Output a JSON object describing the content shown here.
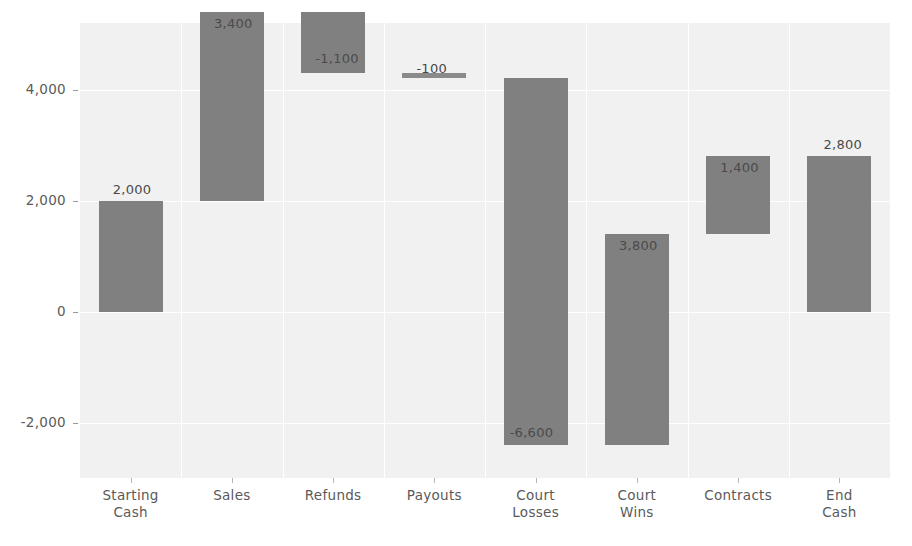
{
  "chart_data": {
    "type": "bar",
    "subtype": "waterfall",
    "title": "",
    "subtitle": "",
    "xlabel": "",
    "ylabel": "",
    "legend": [],
    "legend_position": "none",
    "grid": true,
    "ylim": [
      -3000,
      5200
    ],
    "yticks": [
      -2000,
      0,
      2000,
      4000
    ],
    "ytick_labels": [
      "-2,000",
      "0",
      "2,000",
      "4,000"
    ],
    "categories": [
      "Starting\nCash",
      "Sales",
      "Refunds",
      "Payouts",
      "Court\nLosses",
      "Court\nWins",
      "Contracts",
      "End\nCash"
    ],
    "values": [
      2000,
      3400,
      -1100,
      -100,
      -6600,
      3800,
      1400,
      2800
    ],
    "data_labels": [
      "2,000",
      "3,400",
      "-1,100",
      "-100",
      "-6,600",
      "3,800",
      "1,400",
      "2,800"
    ],
    "bars": [
      {
        "category": "Starting\nCash",
        "label": "2,000",
        "value": 2000,
        "base": 0,
        "top": 2000,
        "type": "total"
      },
      {
        "category": "Sales",
        "label": "3,400",
        "value": 3400,
        "base": 2000,
        "top": 5400,
        "type": "increase"
      },
      {
        "category": "Refunds",
        "label": "-1,100",
        "value": -1100,
        "base": 5400,
        "top": 4300,
        "type": "decrease"
      },
      {
        "category": "Payouts",
        "label": "-100",
        "value": -100,
        "base": 4300,
        "top": 4200,
        "type": "decrease"
      },
      {
        "category": "Court\nLosses",
        "label": "-6,600",
        "value": -6600,
        "base": 4200,
        "top": -2400,
        "type": "decrease"
      },
      {
        "category": "Court\nWins",
        "label": "3,800",
        "value": 3800,
        "base": -2400,
        "top": 1400,
        "type": "increase"
      },
      {
        "category": "Contracts",
        "label": "1,400",
        "value": 1400,
        "base": 1400,
        "top": 2800,
        "type": "increase"
      },
      {
        "category": "End\nCash",
        "label": "2,800",
        "value": 2800,
        "base": 0,
        "top": 2800,
        "type": "total"
      }
    ],
    "colors": {
      "bar": "#808080",
      "plot_background": "#f1f1f1",
      "gridline": "#ffffff",
      "axis_text": "#5a5a5a",
      "label_text": "#4a4a4a",
      "page_background": "#ffffff"
    }
  }
}
